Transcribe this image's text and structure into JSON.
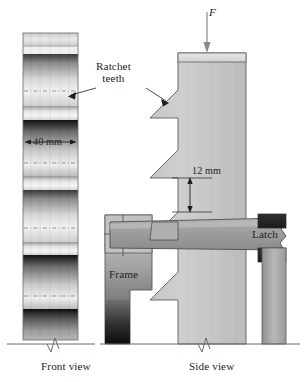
{
  "figure": {
    "views": [
      {
        "name": "front-view",
        "label": "Front view"
      },
      {
        "name": "side-view",
        "label": "Side view"
      }
    ],
    "labels": {
      "force": "F",
      "ratchet_teeth_line1": "Ratchet",
      "ratchet_teeth_line2": "teeth",
      "frame": "Frame",
      "latch": "Latch",
      "front_view": "Front view",
      "side_view": "Side view"
    },
    "dimensions": [
      {
        "name": "post-width",
        "value": "40 mm",
        "orientation": "horizontal",
        "view": "front-view"
      },
      {
        "name": "tooth-pitch",
        "value": "12 mm",
        "orientation": "vertical",
        "view": "side-view"
      }
    ],
    "colors": {
      "outline": "#231f20",
      "paper": "#ffffff",
      "post_light": "#d9d9d9",
      "post_mid": "#b4b4b4",
      "frame_mid": "#a8a8a8",
      "frame_dark": "#4a4a4a",
      "latch_mid": "#9e9e9e",
      "dark_band": "#1a1a1a",
      "ground": "#7a7a7a"
    }
  }
}
